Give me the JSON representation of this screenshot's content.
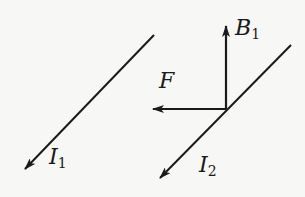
{
  "diagram": {
    "title": "",
    "colors": {
      "background": "#f7f7f5",
      "stroke": "#1a1a1a"
    },
    "wires": [
      {
        "id": "wire-1",
        "current_label": "I",
        "current_subscript": "1",
        "direction": "down-left"
      },
      {
        "id": "wire-2",
        "current_label": "I",
        "current_subscript": "2",
        "direction": "down-left"
      }
    ],
    "vectors": [
      {
        "id": "magnetic-field",
        "label": "B",
        "subscript": "1",
        "direction": "up"
      },
      {
        "id": "force",
        "label": "F",
        "subscript": "",
        "direction": "left"
      }
    ]
  }
}
